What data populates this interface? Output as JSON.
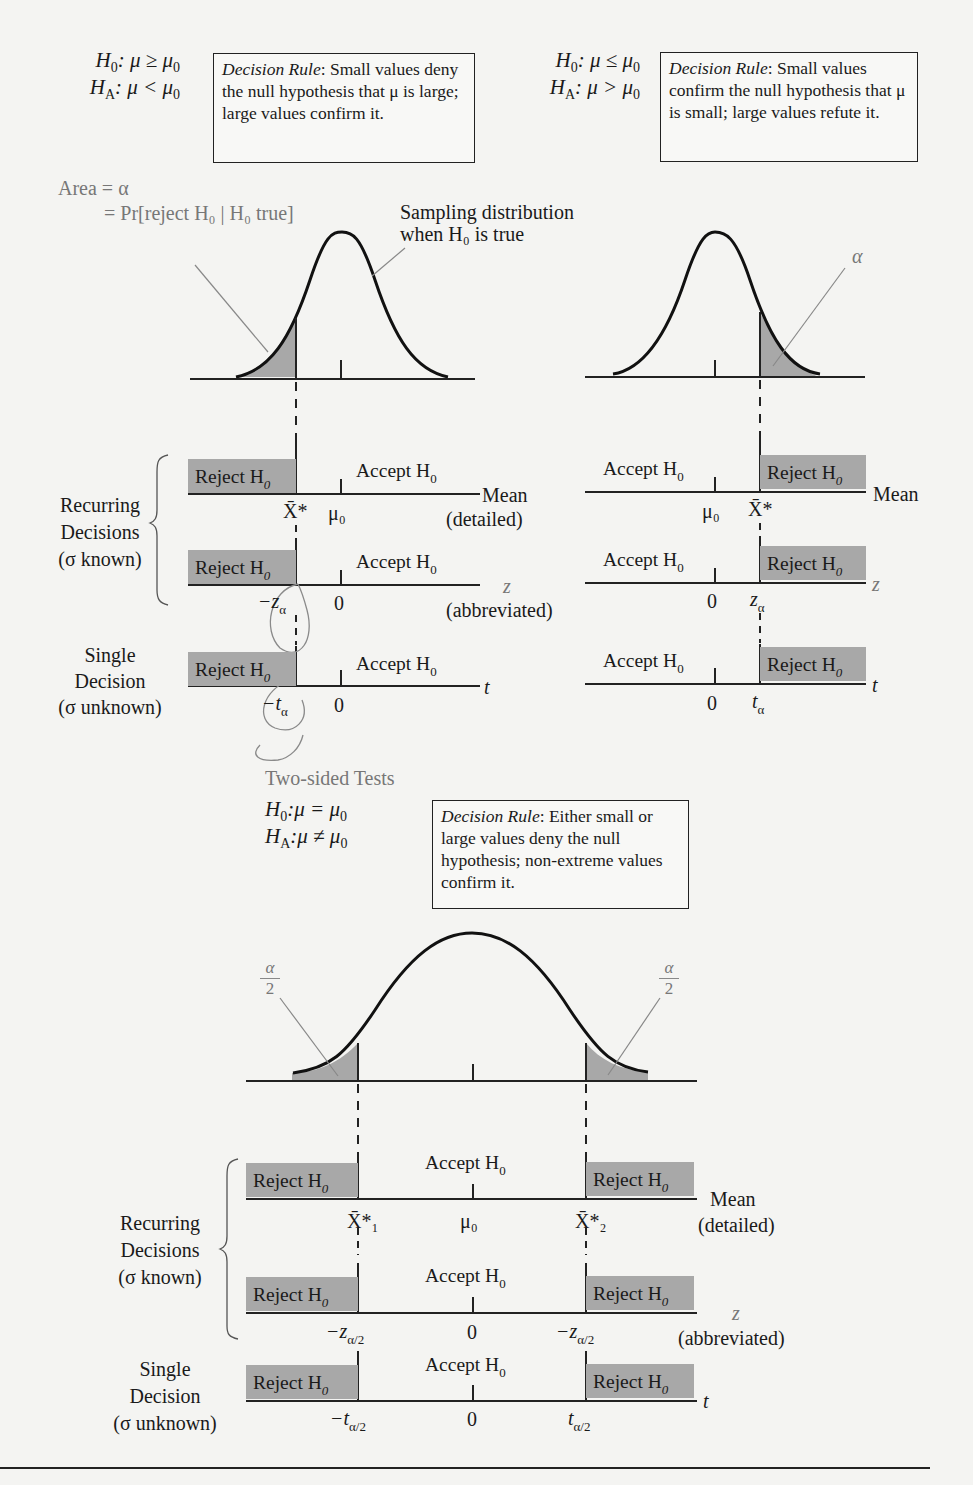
{
  "one_sided_left": {
    "h0": "H",
    "h0_sub": "0",
    "h0_rel": ": μ ≥ μ",
    "h0_rel_sub": "0",
    "ha": "H",
    "ha_sub": "A",
    "ha_rel": ": μ < μ",
    "ha_rel_sub": "0",
    "rule_title": "Decision Rule",
    "rule_text": ": Small values deny the null hypothesis that μ is large; large values confirm it.",
    "area_line1": "Area = α",
    "area_line2": "= Pr[reject H₀ | H₀ true]",
    "sampling_label_line1": "Sampling distribution",
    "sampling_label_line2": "when H₀ is true",
    "rows": [
      {
        "reject": "Reject H",
        "accept": "Accept H",
        "sub": "0",
        "axis": "Mean",
        "axis_note": "(detailed)",
        "tick_critical": "X̄*",
        "tick_center": "μ₀"
      },
      {
        "reject": "Reject H",
        "accept": "Accept H",
        "sub": "0",
        "axis": "z",
        "axis_note": "(abbreviated)",
        "tick_critical": "−z",
        "tick_critical_sub": "α",
        "tick_center": "0"
      },
      {
        "reject": "Reject H",
        "accept": "Accept H",
        "sub": "0",
        "axis": "t",
        "tick_critical": "−t",
        "tick_critical_sub": "α",
        "tick_center": "0"
      }
    ],
    "group_recurring": [
      "Recurring",
      "Decisions",
      "(σ known)"
    ],
    "group_single": [
      "Single",
      "Decision",
      "(σ unknown)"
    ]
  },
  "one_sided_right": {
    "h0": "H",
    "h0_sub": "0",
    "h0_rel": ": μ ≤ μ",
    "h0_rel_sub": "0",
    "ha": "H",
    "ha_sub": "A",
    "ha_rel": ": μ > μ",
    "ha_rel_sub": "0",
    "rule_title": "Decision Rule",
    "rule_text": ": Small values confirm the null hypothesis that μ is small; large values refute it.",
    "alpha_label": "α",
    "rows": [
      {
        "reject": "Reject H",
        "accept": "Accept H",
        "sub": "0",
        "axis": "Mean",
        "tick_critical": "X̄*",
        "tick_center": "μ₀"
      },
      {
        "reject": "Reject H",
        "accept": "Accept H",
        "sub": "0",
        "axis": "z",
        "tick_critical": "z",
        "tick_critical_sub": "α",
        "tick_center": "0"
      },
      {
        "reject": "Reject H",
        "accept": "Accept H",
        "sub": "0",
        "axis": "t",
        "tick_critical": "t",
        "tick_critical_sub": "α",
        "tick_center": "0"
      }
    ]
  },
  "two_sided": {
    "title": "Two-sided Tests",
    "h0": "H",
    "h0_sub": "0",
    "h0_rel": ":μ = μ",
    "h0_rel_sub": "0",
    "ha": "H",
    "ha_sub": "A",
    "ha_rel": ":μ ≠ μ",
    "ha_rel_sub": "0",
    "rule_title": "Decision Rule",
    "rule_text": ": Either small or large values deny the null hypothesis; non-extreme values confirm it.",
    "tail_label_num": "α",
    "tail_label_den": "2",
    "rows": [
      {
        "reject": "Reject H",
        "accept": "Accept H",
        "sub": "0",
        "axis": "Mean",
        "axis_note": "(detailed)",
        "tick_left": "X̄*₁",
        "tick_center": "μ₀",
        "tick_right": "X̄*₂"
      },
      {
        "reject": "Reject H",
        "accept": "Accept H",
        "sub": "0",
        "axis": "z",
        "axis_note": "(abbreviated)",
        "tick_left": "−z",
        "tick_left_sub": "α/2",
        "tick_center": "0",
        "tick_right": "−z",
        "tick_right_sub": "α/2"
      },
      {
        "reject": "Reject H",
        "accept": "Accept H",
        "sub": "0",
        "axis": "t",
        "tick_left": "−t",
        "tick_left_sub": "α/2",
        "tick_center": "0",
        "tick_right": "t",
        "tick_right_sub": "α/2"
      }
    ],
    "group_recurring": [
      "Recurring",
      "Decisions",
      "(σ known)"
    ],
    "group_single": [
      "Single",
      "Decision",
      "(σ unknown)"
    ]
  },
  "colors": {
    "reject_fill": "#a8a8a8",
    "curve": "#111111",
    "annotation": "#888888",
    "pen_mark": "#8a8a8a"
  }
}
